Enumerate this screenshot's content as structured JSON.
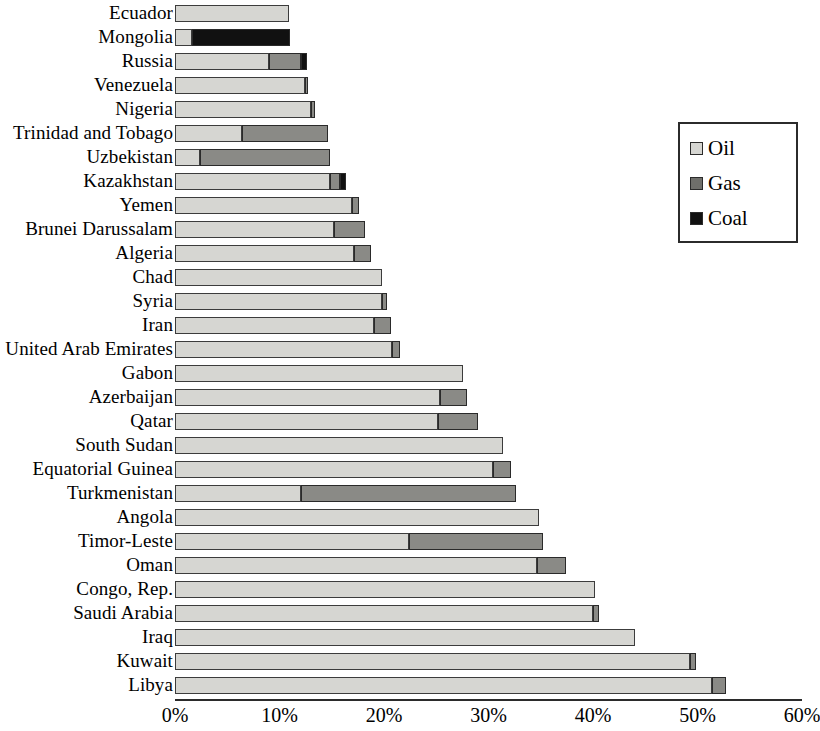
{
  "chart_data": {
    "type": "bar",
    "orientation": "horizontal",
    "stacked": true,
    "title": "",
    "subtitle": "",
    "xlabel": "",
    "ylabel": "",
    "xlim": [
      0,
      60
    ],
    "xtick_labels": [
      "0%",
      "10%",
      "20%",
      "30%",
      "40%",
      "50%",
      "60%"
    ],
    "xtick_values": [
      0,
      10,
      20,
      30,
      40,
      50,
      60
    ],
    "grid": false,
    "legend_position": "right",
    "legend": [
      {
        "name": "Oil",
        "color": "#d6d6d2"
      },
      {
        "name": "Gas",
        "color": "#6f6f6b"
      },
      {
        "name": "Coal",
        "color": "#111111"
      }
    ],
    "series": [
      {
        "name": "Oil",
        "key": "oil",
        "color": "#d6d6d2"
      },
      {
        "name": "Gas",
        "key": "gas",
        "color": "#8a8a86"
      },
      {
        "name": "Coal",
        "key": "coal",
        "color": "#111111"
      }
    ],
    "categories": [
      "Ecuador",
      "Mongolia",
      "Russia",
      "Venezuela",
      "Nigeria",
      "Trinidad and Tobago",
      "Uzbekistan",
      "Kazakhstan",
      "Yemen",
      "Brunei Darussalam",
      "Algeria",
      "Chad",
      "Syria",
      "Iran",
      "United Arab Emirates",
      "Gabon",
      "Azerbaijan",
      "Qatar",
      "South Sudan",
      "Equatorial Guinea",
      "Turkmenistan",
      "Angola",
      "Timor-Leste",
      "Oman",
      "Congo, Rep.",
      "Saudi Arabia",
      "Iraq",
      "Kuwait",
      "Libya"
    ],
    "rows": [
      {
        "label": "Ecuador",
        "oil": 10.9,
        "gas": 0.0,
        "coal": 0.0,
        "total": 10.9
      },
      {
        "label": "Mongolia",
        "oil": 1.6,
        "gas": 0.0,
        "coal": 9.4,
        "total": 11.0
      },
      {
        "label": "Russia",
        "oil": 9.0,
        "gas": 3.1,
        "coal": 0.5,
        "total": 12.6
      },
      {
        "label": "Venezuela",
        "oil": 12.4,
        "gas": 0.3,
        "coal": 0.0,
        "total": 12.7
      },
      {
        "label": "Nigeria",
        "oil": 13.0,
        "gas": 0.4,
        "coal": 0.0,
        "total": 13.4
      },
      {
        "label": "Trinidad and Tobago",
        "oil": 6.4,
        "gas": 8.2,
        "coal": 0.0,
        "total": 14.6
      },
      {
        "label": "Uzbekistan",
        "oil": 2.4,
        "gas": 12.4,
        "coal": 0.0,
        "total": 14.8
      },
      {
        "label": "Kazakhstan",
        "oil": 14.8,
        "gas": 1.0,
        "coal": 0.6,
        "total": 16.4
      },
      {
        "label": "Yemen",
        "oil": 16.9,
        "gas": 0.7,
        "coal": 0.0,
        "total": 17.6
      },
      {
        "label": "Brunei Darussalam",
        "oil": 15.2,
        "gas": 3.0,
        "coal": 0.0,
        "total": 18.2
      },
      {
        "label": "Algeria",
        "oil": 17.1,
        "gas": 1.7,
        "coal": 0.0,
        "total": 18.8
      },
      {
        "label": "Chad",
        "oil": 19.8,
        "gas": 0.0,
        "coal": 0.0,
        "total": 19.8
      },
      {
        "label": "Syria",
        "oil": 19.8,
        "gas": 0.5,
        "coal": 0.0,
        "total": 20.3
      },
      {
        "label": "Iran",
        "oil": 19.0,
        "gas": 1.7,
        "coal": 0.0,
        "total": 20.7
      },
      {
        "label": "United Arab Emirates",
        "oil": 20.8,
        "gas": 0.7,
        "coal": 0.0,
        "total": 21.5
      },
      {
        "label": "Gabon",
        "oil": 27.6,
        "gas": 0.0,
        "coal": 0.0,
        "total": 27.6
      },
      {
        "label": "Azerbaijan",
        "oil": 25.4,
        "gas": 2.5,
        "coal": 0.0,
        "total": 27.9
      },
      {
        "label": "Qatar",
        "oil": 25.2,
        "gas": 3.8,
        "coal": 0.0,
        "total": 29.0
      },
      {
        "label": "South Sudan",
        "oil": 31.4,
        "gas": 0.0,
        "coal": 0.0,
        "total": 31.4
      },
      {
        "label": "Equatorial Guinea",
        "oil": 30.4,
        "gas": 1.8,
        "coal": 0.0,
        "total": 32.2
      },
      {
        "label": "Turkmenistan",
        "oil": 12.1,
        "gas": 20.5,
        "coal": 0.0,
        "total": 32.6
      },
      {
        "label": "Angola",
        "oil": 34.8,
        "gas": 0.0,
        "coal": 0.0,
        "total": 34.8
      },
      {
        "label": "Timor-Leste",
        "oil": 22.4,
        "gas": 12.8,
        "coal": 0.0,
        "total": 35.2
      },
      {
        "label": "Oman",
        "oil": 34.6,
        "gas": 2.8,
        "coal": 0.0,
        "total": 37.4
      },
      {
        "label": "Congo, Rep.",
        "oil": 40.2,
        "gas": 0.0,
        "coal": 0.0,
        "total": 40.2
      },
      {
        "label": "Saudi Arabia",
        "oil": 40.0,
        "gas": 0.6,
        "coal": 0.0,
        "total": 40.6
      },
      {
        "label": "Iraq",
        "oil": 44.0,
        "gas": 0.0,
        "coal": 0.0,
        "total": 44.0
      },
      {
        "label": "Kuwait",
        "oil": 49.3,
        "gas": 0.6,
        "coal": 0.0,
        "total": 49.9
      },
      {
        "label": "Libya",
        "oil": 51.4,
        "gas": 1.3,
        "coal": 0.0,
        "total": 52.7
      }
    ]
  }
}
